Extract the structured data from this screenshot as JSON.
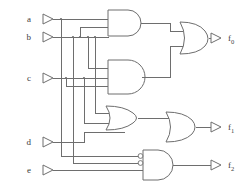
{
  "diagram": {
    "type": "logic-gate-schematic",
    "line_color": "#6e6e6e",
    "background_color": "#ffffff",
    "text_color": "#3b3b3b"
  },
  "inputs": [
    {
      "id": "a",
      "label": "a",
      "x": 34,
      "y": 19
    },
    {
      "id": "b",
      "label": "b",
      "x": 34,
      "y": 37
    },
    {
      "id": "c",
      "label": "c",
      "x": 34,
      "y": 78
    },
    {
      "id": "d",
      "label": "d",
      "x": 34,
      "y": 142
    },
    {
      "id": "e",
      "label": "e",
      "x": 34,
      "y": 170
    }
  ],
  "outputs": [
    {
      "id": "f0",
      "label": "f",
      "subscript": "0",
      "x": 228,
      "y": 38
    },
    {
      "id": "f1",
      "label": "f",
      "subscript": "1",
      "x": 228,
      "y": 127
    },
    {
      "id": "f2",
      "label": "f",
      "subscript": "2",
      "x": 228,
      "y": 164
    }
  ],
  "gates": [
    {
      "id": "and1",
      "type": "AND",
      "inputs": 2,
      "inverted_inputs": 0
    },
    {
      "id": "and2",
      "type": "AND",
      "inputs": 2,
      "inverted_inputs": 0
    },
    {
      "id": "or1",
      "type": "OR",
      "inputs": 2,
      "inverted_inputs": 0
    },
    {
      "id": "or2",
      "type": "OR",
      "inputs": 2,
      "inverted_inputs": 0
    },
    {
      "id": "or3",
      "type": "OR",
      "inputs": 2,
      "inverted_inputs": 0
    },
    {
      "id": "and3",
      "type": "AND",
      "inputs": 3,
      "inverted_inputs": 2
    }
  ],
  "connections": [
    {
      "from": "a",
      "to": "and1"
    },
    {
      "from": "b",
      "to": "and1"
    },
    {
      "from": "b",
      "to": "and2"
    },
    {
      "from": "c",
      "to": "and2"
    },
    {
      "from": "and1",
      "to": "or1"
    },
    {
      "from": "and2",
      "to": "or1"
    },
    {
      "from": "or1",
      "to": "f0"
    },
    {
      "from": "b",
      "to": "or2"
    },
    {
      "from": "c",
      "to": "or2"
    },
    {
      "from": "or2",
      "to": "or3"
    },
    {
      "from": "d",
      "to": "or3"
    },
    {
      "from": "or3",
      "to": "f1"
    },
    {
      "from": "a",
      "to": "and3"
    },
    {
      "from": "b",
      "to": "and3"
    },
    {
      "from": "e",
      "to": "and3"
    },
    {
      "from": "and3",
      "to": "f2"
    }
  ]
}
